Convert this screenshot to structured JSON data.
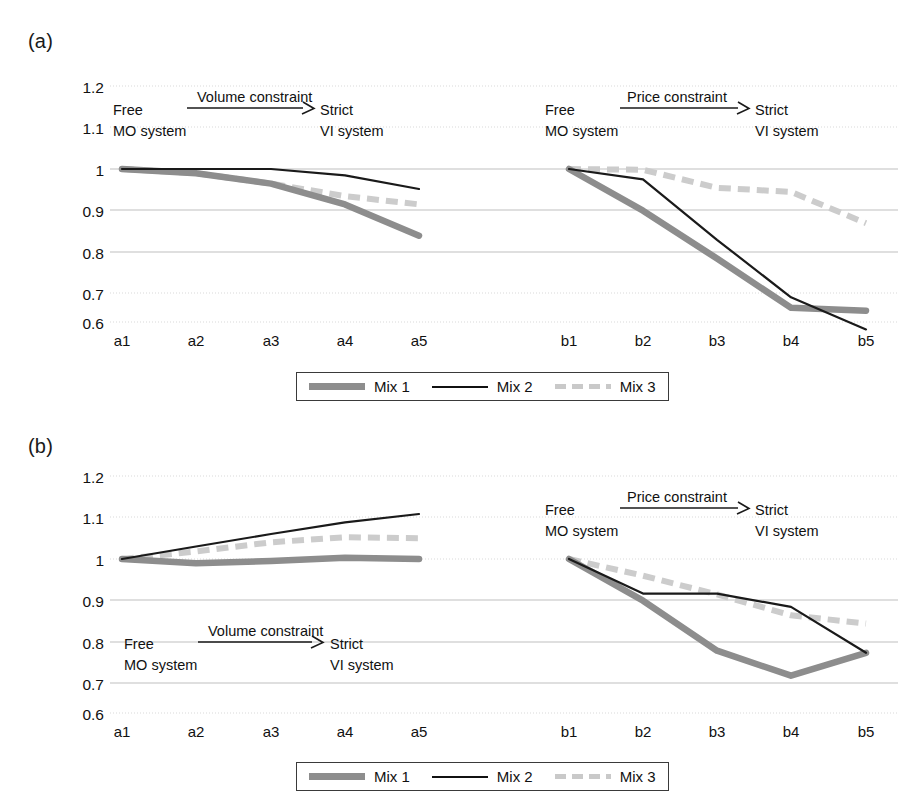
{
  "figure": {
    "panels": [
      {
        "label": "(a)",
        "annotations": [
          {
            "title": "Volume constraint",
            "left_top": "Free",
            "left_bottom": "MO system",
            "right_top": "Strict",
            "right_bottom": "VI system"
          },
          {
            "title": "Price constraint",
            "left_top": "Free",
            "left_bottom": "MO system",
            "right_top": "Strict",
            "right_bottom": "VI system"
          }
        ]
      },
      {
        "label": "(b)",
        "annotations": [
          {
            "title": "Volume constraint",
            "left_top": "Free",
            "left_bottom": "MO system",
            "right_top": "Strict",
            "right_bottom": "VI system"
          },
          {
            "title": "Price constraint",
            "left_top": "Free",
            "left_bottom": "MO system",
            "right_top": "Strict",
            "right_bottom": "VI system"
          }
        ]
      }
    ],
    "legend": {
      "items": [
        {
          "label": "Mix 1",
          "style": "thick-gray-solid",
          "color": "#8d8d8d"
        },
        {
          "label": "Mix 2",
          "style": "thin-black-solid",
          "color": "#111111"
        },
        {
          "label": "Mix 3",
          "style": "gray-dashed",
          "color": "#c9c9c9"
        }
      ]
    }
  },
  "chart_data": [
    {
      "type": "line",
      "title": "(a)",
      "panel": "a",
      "xlabel": "",
      "ylabel": "",
      "ylim": [
        0.6,
        1.2
      ],
      "yticks": [
        "0.6",
        "0.7",
        "0.8",
        "0.9",
        "1",
        "1.1",
        "1.2"
      ],
      "grid": true,
      "legend_position": "bottom-center",
      "groups": [
        {
          "name": "Volume constraint",
          "categories": [
            "a1",
            "a2",
            "a3",
            "a4",
            "a5"
          ],
          "series": [
            {
              "name": "Mix 1",
              "values": [
                1.0,
                0.99,
                0.965,
                0.915,
                0.84
              ]
            },
            {
              "name": "Mix 2",
              "values": [
                1.0,
                1.0,
                1.0,
                0.985,
                0.952
              ]
            },
            {
              "name": "Mix 3",
              "values": [
                1.0,
                0.99,
                0.965,
                0.935,
                0.915
              ]
            }
          ]
        },
        {
          "name": "Price constraint",
          "categories": [
            "b1",
            "b2",
            "b3",
            "b4",
            "b5"
          ],
          "series": [
            {
              "name": "Mix 1",
              "values": [
                1.0,
                0.9,
                0.785,
                0.667,
                0.66
              ]
            },
            {
              "name": "Mix 2",
              "values": [
                1.0,
                0.975,
                0.83,
                0.692,
                0.615
              ]
            },
            {
              "name": "Mix 3",
              "values": [
                1.0,
                0.998,
                0.955,
                0.945,
                0.87
              ]
            }
          ]
        }
      ]
    },
    {
      "type": "line",
      "title": "(b)",
      "panel": "b",
      "xlabel": "",
      "ylabel": "",
      "ylim": [
        0.6,
        1.2
      ],
      "yticks": [
        "0.6",
        "0.7",
        "0.8",
        "0.9",
        "1",
        "1.1",
        "1.2"
      ],
      "grid": true,
      "legend_position": "bottom-center",
      "groups": [
        {
          "name": "Volume constraint",
          "categories": [
            "a1",
            "a2",
            "a3",
            "a4",
            "a5"
          ],
          "series": [
            {
              "name": "Mix 1",
              "values": [
                1.0,
                0.99,
                0.995,
                1.003,
                1.0
              ]
            },
            {
              "name": "Mix 2",
              "values": [
                1.0,
                1.03,
                1.06,
                1.088,
                1.108
              ]
            },
            {
              "name": "Mix 3",
              "values": [
                1.0,
                1.018,
                1.04,
                1.052,
                1.05
              ]
            }
          ]
        },
        {
          "name": "Price constraint",
          "categories": [
            "b1",
            "b2",
            "b3",
            "b4",
            "b5"
          ],
          "series": [
            {
              "name": "Mix 1",
              "values": [
                1.0,
                0.9,
                0.78,
                0.72,
                0.775
              ]
            },
            {
              "name": "Mix 2",
              "values": [
                1.0,
                0.917,
                0.917,
                0.885,
                0.775
              ]
            },
            {
              "name": "Mix 3",
              "values": [
                1.0,
                0.96,
                0.915,
                0.865,
                0.845
              ]
            }
          ]
        }
      ]
    }
  ],
  "axes": {
    "a_categories": [
      "a1",
      "a2",
      "a3",
      "a4",
      "a5"
    ],
    "b_categories": [
      "b1",
      "b2",
      "b3",
      "b4",
      "b5"
    ],
    "yticks": [
      "1.2",
      "1.1",
      "1",
      "0.9",
      "0.8",
      "0.7",
      "0.6"
    ]
  }
}
